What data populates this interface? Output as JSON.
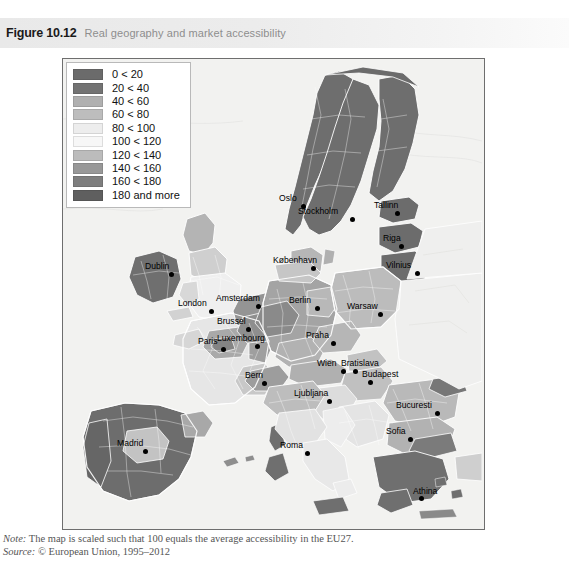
{
  "figure": {
    "number": "Figure 10.12",
    "title": "Real geography and market accessibility"
  },
  "legend": {
    "items": [
      {
        "label": "0 < 20",
        "color": "#6b6b6b"
      },
      {
        "label": "20 < 40",
        "color": "#737373"
      },
      {
        "label": "40 < 60",
        "color": "#b0b0b0"
      },
      {
        "label": "60 < 80",
        "color": "#bdbdbd"
      },
      {
        "label": "80 < 100",
        "color": "#ededed"
      },
      {
        "label": "100 < 120",
        "color": "#f7f7f7"
      },
      {
        "label": "120 < 140",
        "color": "#bcbcbc"
      },
      {
        "label": "140 < 160",
        "color": "#989898"
      },
      {
        "label": "160 < 180",
        "color": "#7e7e7e"
      },
      {
        "label": "180 and more",
        "color": "#5f5f5f"
      }
    ]
  },
  "map": {
    "sea_color": "#f2f2f0",
    "border_color": "#ffffff",
    "cities": [
      {
        "name": "Oslo",
        "x": 238,
        "y": 145,
        "lx": -22,
        "ly": -10
      },
      {
        "name": "Stockholm",
        "x": 287,
        "y": 158,
        "lx": -52,
        "ly": -10
      },
      {
        "name": "Tallinn",
        "x": 332,
        "y": 152,
        "lx": -21,
        "ly": -10
      },
      {
        "name": "Riga",
        "x": 336,
        "y": 185,
        "lx": -16,
        "ly": -10
      },
      {
        "name": "Vilnius",
        "x": 352,
        "y": 212,
        "lx": -29,
        "ly": -10
      },
      {
        "name": "København",
        "x": 248,
        "y": 207,
        "lx": -38,
        "ly": -10
      },
      {
        "name": "Dublin",
        "x": 106,
        "y": 213,
        "lx": -24,
        "ly": -10
      },
      {
        "name": "London",
        "x": 146,
        "y": 250,
        "lx": -31,
        "ly": -10
      },
      {
        "name": "Amsterdam",
        "x": 193,
        "y": 245,
        "lx": -40,
        "ly": -10
      },
      {
        "name": "Brussel",
        "x": 183,
        "y": 268,
        "lx": -29,
        "ly": -10
      },
      {
        "name": "Luxembourg",
        "x": 192,
        "y": 285,
        "lx": -38,
        "ly": -10
      },
      {
        "name": "Paris",
        "x": 158,
        "y": 288,
        "lx": -23,
        "ly": -10
      },
      {
        "name": "Berlin",
        "x": 252,
        "y": 247,
        "lx": -26,
        "ly": -10
      },
      {
        "name": "Warsaw",
        "x": 315,
        "y": 253,
        "lx": -31,
        "ly": -10
      },
      {
        "name": "Praha",
        "x": 268,
        "y": 282,
        "lx": -25,
        "ly": -10
      },
      {
        "name": "Wien",
        "x": 278,
        "y": 310,
        "lx": -24,
        "ly": -10
      },
      {
        "name": "Bratislava",
        "x": 290,
        "y": 310,
        "lx": -12,
        "ly": -10
      },
      {
        "name": "Budapest",
        "x": 305,
        "y": 321,
        "lx": -6,
        "ly": -10
      },
      {
        "name": "Bern",
        "x": 199,
        "y": 322,
        "lx": -17,
        "ly": -10
      },
      {
        "name": "Ljubljana",
        "x": 264,
        "y": 340,
        "lx": -33,
        "ly": -10
      },
      {
        "name": "Bucuresti",
        "x": 372,
        "y": 352,
        "lx": -39,
        "ly": -10
      },
      {
        "name": "Sofia",
        "x": 345,
        "y": 378,
        "lx": -22,
        "ly": -10
      },
      {
        "name": "Madrid",
        "x": 80,
        "y": 390,
        "lx": -26,
        "ly": -10
      },
      {
        "name": "Roma",
        "x": 242,
        "y": 392,
        "lx": -25,
        "ly": -10
      },
      {
        "name": "Athina",
        "x": 356,
        "y": 437,
        "lx": -6,
        "ly": -9
      }
    ]
  },
  "caption": {
    "note_label": "Note:",
    "note_text": " The map is scaled such that 100 equals the average accessibility in the EU27.",
    "source_label": "Source:",
    "source_text": " © European Union, 1995–2012"
  }
}
